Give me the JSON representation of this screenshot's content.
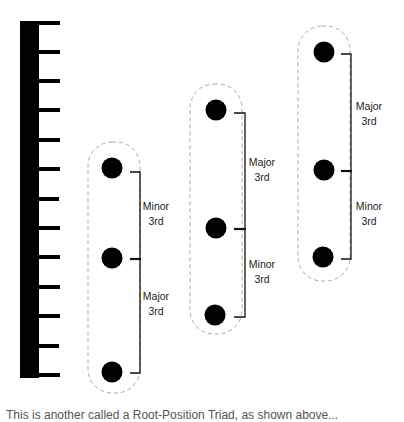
{
  "diagram": {
    "ruler": {
      "tick_count": 13,
      "color": "#000000"
    },
    "chords": [
      {
        "name": "chord-1",
        "notes": 3,
        "intervals": [
          {
            "line1": "Minor",
            "line2": "3rd"
          },
          {
            "line1": "Major",
            "line2": "3rd"
          }
        ]
      },
      {
        "name": "chord-2",
        "notes": 3,
        "intervals": [
          {
            "line1": "Major",
            "line2": "3rd"
          },
          {
            "line1": "Minor",
            "line2": "3rd"
          }
        ]
      },
      {
        "name": "chord-3",
        "notes": 3,
        "intervals": [
          {
            "line1": "Major",
            "line2": "3rd"
          },
          {
            "line1": "Minor",
            "line2": "3rd"
          }
        ]
      }
    ],
    "colors": {
      "note": "#000000",
      "box_border": "#aaaaaa",
      "bracket": "#111111"
    },
    "caption": "This is another called a Root-Position Triad, as shown above..."
  }
}
